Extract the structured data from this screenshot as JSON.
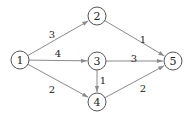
{
  "graph": {
    "type": "directed-weighted-graph",
    "colors": {
      "edge": "#8a8a8a",
      "node_stroke": "#555555",
      "text": "#222222",
      "background": "#ffffff"
    },
    "nodes": [
      {
        "id": "1",
        "label": "1",
        "x": 20,
        "y": 60
      },
      {
        "id": "2",
        "label": "2",
        "x": 97,
        "y": 16
      },
      {
        "id": "3",
        "label": "3",
        "x": 97,
        "y": 61
      },
      {
        "id": "4",
        "label": "4",
        "x": 97,
        "y": 102
      },
      {
        "id": "5",
        "label": "5",
        "x": 173,
        "y": 61
      }
    ],
    "edges": [
      {
        "from": "1",
        "to": "2",
        "weight": "3",
        "label_x": 52,
        "label_y": 34
      },
      {
        "from": "1",
        "to": "3",
        "weight": "4",
        "label_x": 58,
        "label_y": 53
      },
      {
        "from": "1",
        "to": "4",
        "weight": "2",
        "label_x": 52,
        "label_y": 89
      },
      {
        "from": "2",
        "to": "5",
        "weight": "1",
        "label_x": 143,
        "label_y": 39
      },
      {
        "from": "3",
        "to": "5",
        "weight": "3",
        "label_x": 134,
        "label_y": 58
      },
      {
        "from": "3",
        "to": "4",
        "weight": "1",
        "label_x": 103,
        "label_y": 80
      },
      {
        "from": "4",
        "to": "5",
        "weight": "2",
        "label_x": 143,
        "label_y": 88
      }
    ]
  }
}
